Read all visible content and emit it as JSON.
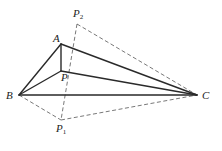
{
  "diagram": {
    "type": "geometry",
    "points": {
      "A": {
        "label": "A",
        "sub": "",
        "x": 61,
        "y": 44,
        "lx": 53,
        "ly": 42
      },
      "P": {
        "label": "P",
        "sub": "",
        "x": 61,
        "y": 71,
        "lx": 61,
        "ly": 81
      },
      "B": {
        "label": "B",
        "sub": "",
        "x": 19,
        "y": 95,
        "lx": 6,
        "ly": 99
      },
      "C": {
        "label": "C",
        "sub": "",
        "x": 197,
        "y": 95,
        "lx": 202,
        "ly": 99
      },
      "P1": {
        "label": "P",
        "sub": "1",
        "x": 61,
        "y": 120,
        "lx": 56,
        "ly": 132
      },
      "P2": {
        "label": "P",
        "sub": "2",
        "x": 77,
        "y": 24,
        "lx": 73,
        "ly": 17
      }
    },
    "solid_segments": [
      [
        "A",
        "B"
      ],
      [
        "A",
        "C"
      ],
      [
        "A",
        "P"
      ],
      [
        "B",
        "P"
      ],
      [
        "P",
        "C"
      ],
      [
        "B",
        "C"
      ]
    ],
    "dashed_segments": [
      [
        "P2",
        "P1"
      ],
      [
        "P2",
        "C"
      ],
      [
        "B",
        "P1"
      ],
      [
        "P1",
        "C"
      ]
    ]
  }
}
